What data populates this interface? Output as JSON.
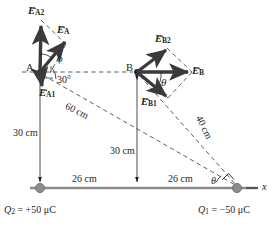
{
  "figure": {
    "colors": {
      "line": "#231f20",
      "vector": "#3a3a3c",
      "charge_dot": "#8c8c8e",
      "dashed": "#4d4d4f"
    }
  },
  "points": {
    "A": {
      "label": "A",
      "x": 40,
      "y": 72
    },
    "B": {
      "label": "B",
      "x": 137,
      "y": 72
    }
  },
  "vectors": [
    {
      "name": "E_A2",
      "label_main": "E",
      "label_sub": "A2",
      "at": "A",
      "direction": "up"
    },
    {
      "name": "E_A",
      "label_main": "E",
      "label_sub": "A",
      "at": "A",
      "direction": "up-right"
    },
    {
      "name": "E_A1",
      "label_main": "E",
      "label_sub": "A1",
      "at": "A",
      "direction": "down"
    },
    {
      "name": "E_B2",
      "label_main": "E",
      "label_sub": "B2",
      "at": "B",
      "direction": "up-right"
    },
    {
      "name": "E_B",
      "label_main": "E",
      "label_sub": "B",
      "at": "B",
      "direction": "right"
    },
    {
      "name": "E_B1",
      "label_main": "E",
      "label_sub": "B1",
      "at": "B",
      "direction": "down-right"
    }
  ],
  "angles": {
    "phi": "ϕ",
    "thirty": "30°",
    "theta_B": "θ",
    "theta_Q1": "θ"
  },
  "dimensions": {
    "a_to_axis": "30 cm",
    "b_to_axis": "30 cm",
    "a_to_q1": "60 cm",
    "b_to_q1": "40 cm",
    "q2_to_mid": "26 cm",
    "mid_to_q1": "26 cm"
  },
  "charges": {
    "q2": {
      "symbol": "Q",
      "sub": "2",
      "eq": "= +50 μC",
      "value": "+50 μC"
    },
    "q1": {
      "symbol": "Q",
      "sub": "1",
      "eq": "= −50 μC",
      "value": "−50 μC"
    }
  },
  "axis": {
    "label": "x"
  }
}
